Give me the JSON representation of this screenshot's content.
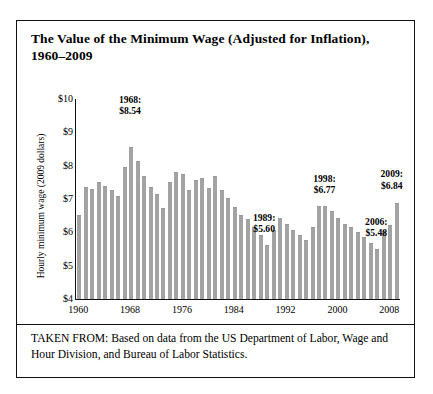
{
  "figure": {
    "title": "The Value of the Minimum Wage (Adjusted for Inflation), 1960–2009",
    "source_note": "TAKEN FROM: Based on data from the US Department of Labor, Wage and Hour Division, and Bureau of Labor Statistics."
  },
  "chart_data": {
    "type": "bar",
    "title": "The Value of the Minimum Wage (Adjusted for Inflation), 1960–2009",
    "xlabel": "",
    "ylabel": "Hourly minimum wage (2009 dollars)",
    "ylim": [
      4,
      10
    ],
    "ytick_labels": [
      "$10",
      "$9",
      "$8",
      "$7",
      "$6",
      "$5",
      "$4"
    ],
    "ytick_values": [
      10,
      9,
      8,
      7,
      6,
      5,
      4
    ],
    "xtick_labels": [
      "1960",
      "1968",
      "1976",
      "1984",
      "1992",
      "2000",
      "2008"
    ],
    "xtick_values": [
      1960,
      1968,
      1976,
      1984,
      1992,
      2000,
      2008
    ],
    "grid": false,
    "legend": "none",
    "bar_color": "#a3a3a3",
    "categories": [
      1960,
      1961,
      1962,
      1963,
      1964,
      1965,
      1966,
      1967,
      1968,
      1969,
      1970,
      1971,
      1972,
      1973,
      1974,
      1975,
      1976,
      1977,
      1978,
      1979,
      1980,
      1981,
      1982,
      1983,
      1984,
      1985,
      1986,
      1987,
      1988,
      1989,
      1990,
      1991,
      1992,
      1993,
      1994,
      1995,
      1996,
      1997,
      1998,
      1999,
      2000,
      2001,
      2002,
      2003,
      2004,
      2005,
      2006,
      2007,
      2008,
      2009
    ],
    "values": [
      6.5,
      7.34,
      7.26,
      7.47,
      7.37,
      7.25,
      7.05,
      7.93,
      8.54,
      8.1,
      7.66,
      7.34,
      7.11,
      6.69,
      7.47,
      7.78,
      7.71,
      7.24,
      7.55,
      7.6,
      7.3,
      7.67,
      7.23,
      7.01,
      6.72,
      6.49,
      6.37,
      6.14,
      5.9,
      5.6,
      6.04,
      6.41,
      6.22,
      6.04,
      5.89,
      5.73,
      6.13,
      6.76,
      6.77,
      6.62,
      6.4,
      6.22,
      6.12,
      5.99,
      5.83,
      5.64,
      5.48,
      6.0,
      6.18,
      6.84
    ],
    "annotations": [
      {
        "year": 1968,
        "line1": "1968:",
        "line2": "$8.54",
        "value": 8.54
      },
      {
        "year": 1989,
        "line1": "1989:",
        "line2": "$5.60",
        "value": 5.6
      },
      {
        "year": 1998,
        "line1": "1998:",
        "line2": "$6.77",
        "value": 6.77
      },
      {
        "year": 2006,
        "line1": "2006:",
        "line2": "$5.48",
        "value": 5.48
      },
      {
        "year": 2009,
        "line1": "2009:",
        "line2": "$6.84",
        "value": 6.84
      }
    ]
  }
}
